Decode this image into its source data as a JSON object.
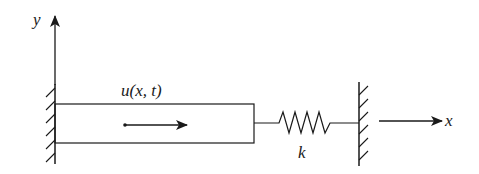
{
  "diagram": {
    "labels": {
      "y_axis": "y",
      "x_axis": "x",
      "displacement": "u(x, t)",
      "spring_constant": "k"
    },
    "colors": {
      "stroke": "#1a1a1a",
      "background": "#ffffff"
    },
    "elements": {
      "left_wall": "fixed support (hatched)",
      "bar": "rectangular bar",
      "direction_arrow": "displacement direction arrow",
      "spring": "linear spring k",
      "right_wall": "fixed support (hatched)"
    }
  }
}
